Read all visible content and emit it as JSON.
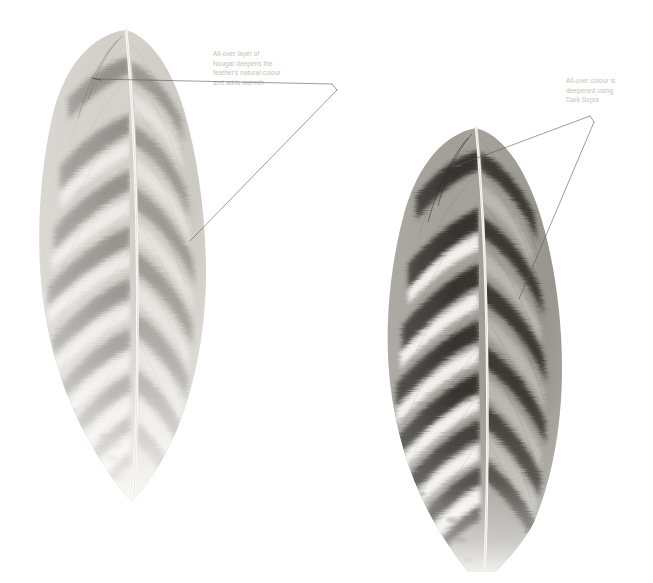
{
  "page": {
    "background": "#ffffff",
    "width": 653,
    "height": 583,
    "kind": "illustration-plate"
  },
  "annotations": [
    {
      "id": "left-callout",
      "text": "All-over layer of\nNougat deepens the\nfeather's natural colour\nand adds warmth",
      "lines": [
        "All-over layer of",
        "Nougat deepens the",
        "feather's natural colour",
        "and adds warmth"
      ],
      "colour_named": "Nougat",
      "text_colour": "#c2bfbc",
      "x": 213,
      "y": 49
    },
    {
      "id": "right-callout",
      "text": "All-over colour is\ndeepened using\nDark Sepia",
      "lines": [
        "All-over colour is",
        "deepened using",
        "Dark Sepia"
      ],
      "colour_named": "Dark Sepia",
      "text_colour": "#c2bfbc",
      "x": 566,
      "y": 76
    }
  ],
  "leaders": {
    "stroke": "#5a5a5a",
    "stroke_width": 0.6,
    "left": {
      "apex": [
        332,
        84
      ],
      "elbow": [
        337,
        90
      ],
      "targets": [
        [
          96,
          79
        ],
        [
          190,
          241
        ]
      ]
    },
    "right": {
      "apex": [
        590,
        116
      ],
      "elbow": [
        594,
        122
      ],
      "targets": [
        [
          456,
          166
        ],
        [
          519,
          299
        ]
      ]
    }
  },
  "figures": [
    {
      "id": "feather-stage-1",
      "label": "left feather",
      "stage": "base colour with Nougat warm layer",
      "tone": "light warm grey",
      "tip_direction": "down",
      "bands": 10,
      "palette": {
        "band_dark": "#8d8a85",
        "band_light": "#f2f0ed",
        "vane_base": "#cfccc7",
        "rachis": "#fbfaf8"
      },
      "x": 18,
      "y": 22,
      "w": 235,
      "h": 490
    },
    {
      "id": "feather-stage-2",
      "label": "right feather",
      "stage": "all-over colour deepened with Dark Sepia",
      "tone": "dark sepia / high contrast",
      "tip_direction": "down",
      "bands": 10,
      "palette": {
        "band_dark": "#3a3734",
        "band_light": "#f6f5f3",
        "vane_base": "#9b9892",
        "rachis": "#fdfcfa"
      },
      "x": 360,
      "y": 122,
      "w": 250,
      "h": 450
    }
  ]
}
